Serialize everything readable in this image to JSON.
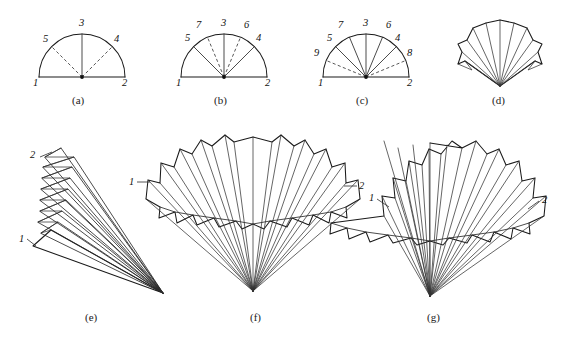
{
  "figure": {
    "background": "#ffffff",
    "ink_color": "#1a1a1a",
    "dash_color": "#3a3a3a",
    "width": 566,
    "height": 339
  },
  "panels": [
    {
      "id": "a",
      "caption": "(a)",
      "type": "semicircle-construction",
      "description": "Semicircle with one solid vertical radius and two dashed diagonal radii",
      "center": [
        82,
        77
      ],
      "radius": 43,
      "base_labels": [
        "1",
        "2"
      ],
      "rib_labels": [
        "3",
        "4",
        "5"
      ],
      "solid_ribs": [
        "3"
      ],
      "dashed_ribs": [
        "4",
        "5"
      ],
      "rib_angles_deg": {
        "3": 90,
        "4": 45,
        "5": 135
      }
    },
    {
      "id": "b",
      "caption": "(b)",
      "type": "semicircle-construction",
      "description": "Semicircle with three solid radii and two dashed radii",
      "center": [
        224,
        77
      ],
      "radius": 43,
      "base_labels": [
        "1",
        "2"
      ],
      "rib_labels": [
        "3",
        "4",
        "5",
        "6",
        "7"
      ],
      "solid_ribs": [
        "3",
        "4",
        "5"
      ],
      "dashed_ribs": [
        "6",
        "7"
      ],
      "rib_angles_deg": {
        "3": 90,
        "4": 45,
        "5": 135,
        "6": 67.5,
        "7": 112.5
      }
    },
    {
      "id": "c",
      "caption": "(c)",
      "type": "semicircle-construction",
      "description": "Semicircle with five solid radii and two dashed near-horizontal radii",
      "center": [
        366,
        77
      ],
      "radius": 43,
      "base_labels": [
        "1",
        "2"
      ],
      "rib_labels": [
        "3",
        "4",
        "5",
        "6",
        "7",
        "8",
        "9"
      ],
      "solid_ribs": [
        "3",
        "4",
        "5",
        "6",
        "7"
      ],
      "dashed_ribs": [
        "8",
        "9"
      ],
      "rib_angles_deg": {
        "3": 90,
        "4": 45,
        "5": 135,
        "6": 67.5,
        "7": 112.5,
        "8": 22.5,
        "9": 157.5
      }
    },
    {
      "id": "d",
      "caption": "(d)",
      "type": "folded-fan",
      "description": "Partly folded fan, narrow opening, apex at bottom",
      "apex": [
        500,
        86
      ],
      "pleat_count": 8
    },
    {
      "id": "e",
      "caption": "(e)",
      "type": "collapsed-fan",
      "description": "Fully collapsed fan with accordion pleats at upper left converging to a point at lower right",
      "apex": [
        163,
        293
      ],
      "pleat_count": 8,
      "labels": [
        "1",
        "2"
      ]
    },
    {
      "id": "f",
      "caption": "(f)",
      "type": "open-fan",
      "description": "Opened pleated fan with zigzag outer edge and scalloped inner arc",
      "apex": [
        253,
        291
      ],
      "pleat_count": 13,
      "labels": [
        "1",
        "2"
      ]
    },
    {
      "id": "g",
      "caption": "(g)",
      "type": "open-fan",
      "description": "Widely opened pleated fan with zigzag outer edge and scalloped inner arc",
      "apex": [
        430,
        296
      ],
      "pleat_count": 13,
      "labels": [
        "1",
        "2"
      ]
    }
  ],
  "annotations": {
    "a": {
      "n1": "1",
      "n2": "2",
      "n3": "3",
      "n4": "4",
      "n5": "5",
      "pos": {
        "n1": [
          33,
          78
        ],
        "n2": [
          122,
          78
        ],
        "n3": [
          79,
          18
        ],
        "n4": [
          114,
          34
        ],
        "n5": [
          43,
          34
        ]
      }
    },
    "b": {
      "n1": "1",
      "n2": "2",
      "n3": "3",
      "n4": "4",
      "n5": "5",
      "n6": "6",
      "n7": "7",
      "pos": {
        "n1": [
          176,
          78
        ],
        "n2": [
          265,
          78
        ],
        "n3": [
          221,
          18
        ],
        "n4": [
          256,
          33
        ],
        "n5": [
          185,
          33
        ],
        "n6": [
          244,
          20
        ],
        "n7": [
          196,
          20
        ]
      }
    },
    "c": {
      "n1": "1",
      "n2": "2",
      "n3": "3",
      "n4": "4",
      "n5": "5",
      "n6": "6",
      "n7": "7",
      "n8": "8",
      "n9": "9",
      "pos": {
        "n1": [
          318,
          78
        ],
        "n2": [
          407,
          78
        ],
        "n3": [
          363,
          18
        ],
        "n4": [
          395,
          33
        ],
        "n5": [
          327,
          33
        ],
        "n6": [
          386,
          20
        ],
        "n7": [
          338,
          20
        ],
        "n8": [
          407,
          48
        ],
        "n9": [
          315,
          48
        ]
      }
    },
    "e": {
      "n1": "1",
      "n2": "2",
      "pos": {
        "n1": [
          19,
          238
        ],
        "n2": [
          30,
          155
        ]
      }
    },
    "f": {
      "n1": "1",
      "n2": "2",
      "pos": {
        "n1": [
          129,
          178
        ],
        "n2": [
          340,
          182
        ]
      }
    },
    "g": {
      "n1": "1",
      "n2": "2",
      "pos": {
        "n1": [
          370,
          196
        ],
        "n2": [
          542,
          198
        ]
      }
    }
  },
  "captions": {
    "a": "(a)",
    "b": "(b)",
    "c": "(c)",
    "d": "(d)",
    "e": "(e)",
    "f": "(f)",
    "g": "(g)",
    "pos": {
      "a": [
        72,
        95
      ],
      "b": [
        214,
        95
      ],
      "c": [
        356,
        95
      ],
      "d": [
        492,
        95
      ],
      "e": [
        85,
        312
      ],
      "f": [
        250,
        312
      ],
      "g": [
        427,
        312
      ]
    }
  }
}
